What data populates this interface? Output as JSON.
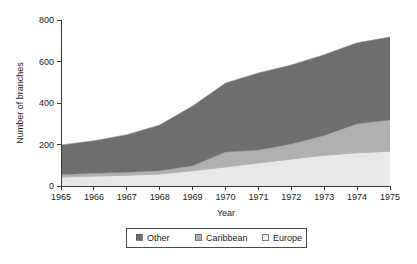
{
  "chart_data": {
    "type": "area",
    "title": "",
    "xlabel": "Year",
    "ylabel": "Number of branches",
    "categories": [
      "1965",
      "1966",
      "1967",
      "1968",
      "1969",
      "1970",
      "1971",
      "1972",
      "1973",
      "1974",
      "1975"
    ],
    "x": [
      1965,
      1966,
      1967,
      1968,
      1969,
      1970,
      1971,
      1972,
      1973,
      1974,
      1975
    ],
    "stacked": true,
    "stack_order_bottom_to_top": [
      "Europe",
      "Caribbean",
      "Other"
    ],
    "series": [
      {
        "name": "Europe",
        "color": "#e8e8e8",
        "values": [
          43,
          48,
          52,
          58,
          74,
          92,
          111,
          130,
          148,
          160,
          168
        ]
      },
      {
        "name": "Caribbean",
        "color": "#b0b0b0",
        "values": [
          12,
          13,
          14,
          16,
          24,
          72,
          62,
          72,
          95,
          140,
          150
        ]
      },
      {
        "name": "Other",
        "color": "#6e6e6e",
        "values": [
          143,
          157,
          181,
          220,
          287,
          332,
          372,
          381,
          390,
          390,
          400
        ]
      }
    ],
    "cumulative_totals": [
      198,
      218,
      247,
      294,
      385,
      496,
      545,
      583,
      633,
      690,
      718
    ],
    "cumulative_europe": [
      43,
      48,
      52,
      58,
      74,
      92,
      111,
      130,
      148,
      160,
      168
    ],
    "cumulative_europe_caribbean": [
      55,
      61,
      66,
      74,
      98,
      164,
      173,
      202,
      243,
      300,
      318
    ],
    "ytick_labels": [
      "0",
      "200",
      "400",
      "600",
      "800"
    ],
    "yticks": [
      0,
      200,
      400,
      600,
      800
    ],
    "ylim": [
      0,
      800
    ],
    "xlim": [
      1965,
      1975
    ],
    "grid": false,
    "legend_position": "bottom",
    "legend_entries": [
      {
        "label": "Other",
        "color": "#6e6e6e"
      },
      {
        "label": "Caribbean",
        "color": "#b0b0b0"
      },
      {
        "label": "Europe",
        "color": "#f2f2f2"
      }
    ]
  },
  "colors": {
    "other": "#6e6e6e",
    "caribbean": "#b0b0b0",
    "europe": "#ebebeb",
    "axis": "#3a3a3a",
    "text": "#1a1a1a",
    "background": "#ffffff"
  }
}
